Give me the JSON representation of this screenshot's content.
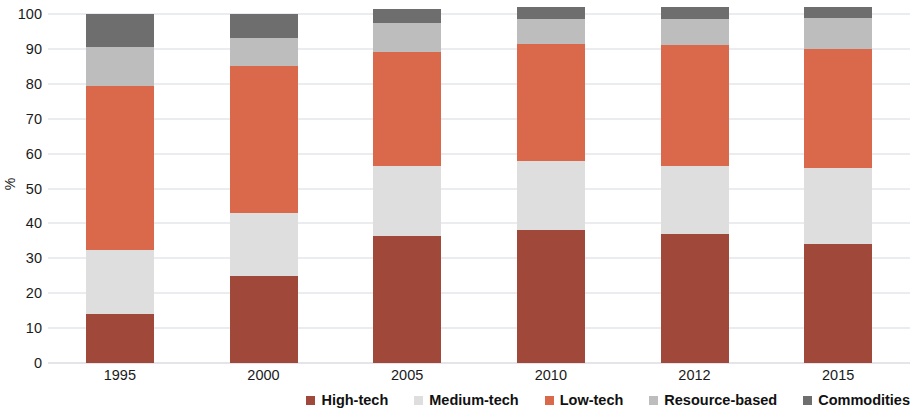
{
  "chart_data": {
    "type": "bar",
    "subtype": "stacked-bar-100",
    "title": "",
    "xlabel": "",
    "ylabel": "%",
    "ylim": [
      0,
      100
    ],
    "yticks": [
      0,
      10,
      20,
      30,
      40,
      50,
      60,
      70,
      80,
      90,
      100
    ],
    "ytick_labels": [
      "0",
      "10",
      "20",
      "30",
      "40",
      "50",
      "60",
      "70",
      "80",
      "90",
      "100"
    ],
    "grid": true,
    "grid_axis": "y",
    "legend_position": "bottom-right",
    "categories": [
      "1995",
      "2000",
      "2005",
      "2010",
      "2012",
      "2015"
    ],
    "series": [
      {
        "name": "High-tech",
        "color": "#A0493A",
        "values": [
          14,
          25,
          36.5,
          38,
          37,
          34
        ]
      },
      {
        "name": "Medium-tech",
        "color": "#DEDEDE",
        "values": [
          18.5,
          18,
          20,
          20,
          19.5,
          22
        ]
      },
      {
        "name": "Low-tech",
        "color": "#D9694A",
        "values": [
          47,
          42,
          32.5,
          33.5,
          34.5,
          34
        ]
      },
      {
        "name": "Resource-based",
        "color": "#BDBDBD",
        "values": [
          11,
          8,
          8.5,
          7,
          7.5,
          9
        ]
      },
      {
        "name": "Commodities",
        "color": "#6E6E6E",
        "values": [
          9.5,
          7,
          4,
          3.5,
          3.5,
          3
        ]
      }
    ],
    "totals": [
      100,
      100,
      101.5,
      102,
      102,
      102
    ]
  },
  "legend": {
    "items": [
      {
        "label": "High-tech",
        "color": "#A0493A"
      },
      {
        "label": "Medium-tech",
        "color": "#DEDEDE"
      },
      {
        "label": "Low-tech",
        "color": "#D9694A"
      },
      {
        "label": "Resource-based",
        "color": "#BDBDBD"
      },
      {
        "label": "Commodities",
        "color": "#6E6E6E"
      }
    ]
  }
}
